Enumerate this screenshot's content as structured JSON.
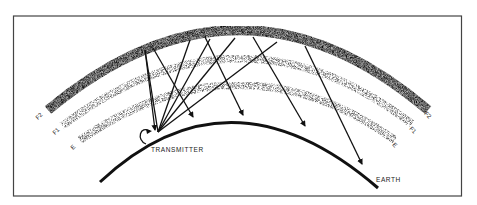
{
  "diagram": {
    "labels": {
      "transmitter": "TRANSMITTER",
      "earth": "EARTH"
    },
    "layers": [
      {
        "id": "F2",
        "label_left": "F2",
        "label_right": "F2",
        "density": "dense"
      },
      {
        "id": "F1",
        "label_left": "F1",
        "label_right": "F1",
        "density": "medium"
      },
      {
        "id": "E",
        "label_left": "E",
        "label_right": "E",
        "density": "medium"
      }
    ],
    "colors": {
      "ink": "#111111",
      "frame": "#444444",
      "background": "#ffffff"
    }
  }
}
